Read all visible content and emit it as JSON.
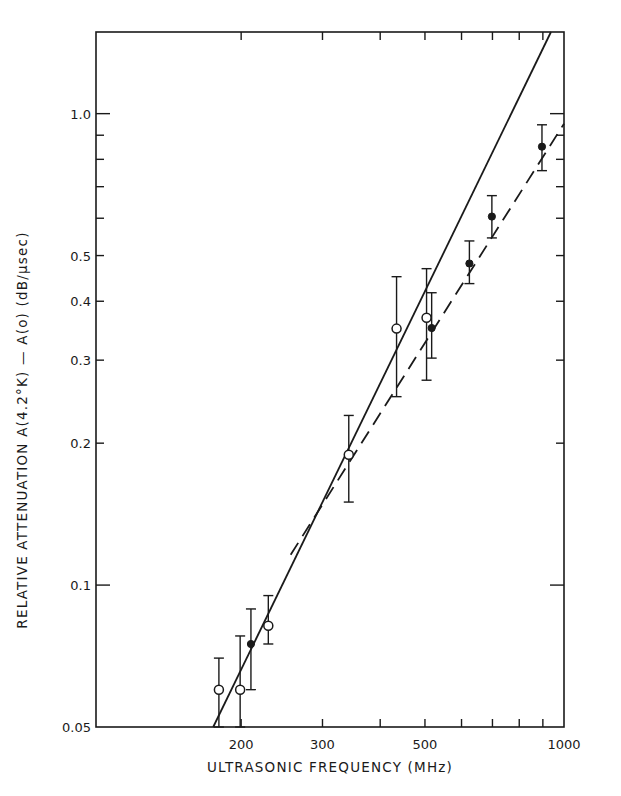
{
  "chart_data": {
    "type": "scatter",
    "title": "",
    "xlabel": "ULTRASONIC FREQUENCY (MHz)",
    "ylabel": "RELATIVE ATTENUATION  A(4.2°K) — A(o)  (dB/μsec)",
    "xscale": "log",
    "yscale": "log",
    "xlim": [
      97,
      1000
    ],
    "ylim": [
      0.05,
      1.49
    ],
    "x_ticks_labeled": [
      200,
      300,
      500,
      1000
    ],
    "x_tick_labels": [
      "200",
      "300",
      "500",
      "1000"
    ],
    "x_minor_ticks": [
      200,
      300,
      400,
      500,
      600,
      700,
      800,
      900
    ],
    "y_ticks_labeled": [
      0.05,
      0.1,
      0.2,
      0.3,
      0.4,
      0.5,
      1.0
    ],
    "y_tick_labels": [
      "0.05",
      "0.1",
      "0.2",
      "0.3",
      "0.4",
      "0.5",
      "1.0"
    ],
    "y_minor_ticks": [
      0.2,
      0.3,
      0.4,
      0.5,
      0.6,
      0.7,
      0.8,
      0.9,
      1.0
    ],
    "y_major_ticks": [
      0.1,
      1.0
    ],
    "grid": false,
    "legend": null,
    "series": [
      {
        "name": "open circles",
        "marker": "open-circle",
        "points": [
          {
            "x": 179,
            "y": 0.06,
            "ylow": 0.05,
            "yhigh": 0.07
          },
          {
            "x": 199,
            "y": 0.06,
            "ylow": 0.05,
            "yhigh": 0.078
          },
          {
            "x": 229,
            "y": 0.082,
            "ylow": 0.075,
            "yhigh": 0.095
          },
          {
            "x": 342,
            "y": 0.189,
            "ylow": 0.15,
            "yhigh": 0.229
          },
          {
            "x": 434,
            "y": 0.35,
            "ylow": 0.251,
            "yhigh": 0.451
          },
          {
            "x": 504,
            "y": 0.369,
            "ylow": 0.272,
            "yhigh": 0.469
          }
        ]
      },
      {
        "name": "filled circles",
        "marker": "filled-circle",
        "points": [
          {
            "x": 210,
            "y": 0.075,
            "ylow": 0.06,
            "yhigh": 0.089
          },
          {
            "x": 517,
            "y": 0.351,
            "ylow": 0.303,
            "yhigh": 0.417
          },
          {
            "x": 624,
            "y": 0.481,
            "ylow": 0.436,
            "yhigh": 0.537
          },
          {
            "x": 698,
            "y": 0.605,
            "ylow": 0.545,
            "yhigh": 0.67
          },
          {
            "x": 896,
            "y": 0.851,
            "ylow": 0.757,
            "yhigh": 0.947
          }
        ]
      }
    ],
    "lines": [
      {
        "name": "solid fit (~f^2)",
        "style": "solid",
        "from": [
          174,
          0.05
        ],
        "to": [
          937,
          1.49
        ]
      },
      {
        "name": "dashed fit",
        "style": "dashed",
        "from": [
          256,
          0.116
        ],
        "to": [
          1000,
          0.952
        ]
      }
    ]
  },
  "layout": {
    "plot_left": 96,
    "plot_right": 564,
    "plot_top": 32,
    "plot_bottom": 727
  }
}
